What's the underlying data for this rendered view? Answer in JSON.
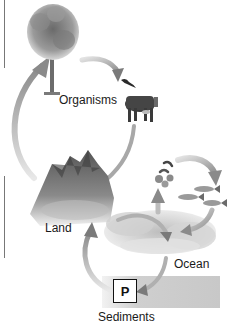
{
  "diagram": {
    "nodes": [
      {
        "id": "organisms",
        "label": "Organisms"
      },
      {
        "id": "land",
        "label": "Land"
      },
      {
        "id": "ocean",
        "label": "Ocean"
      },
      {
        "id": "sediments",
        "label": "Sediments"
      }
    ],
    "sediment_box_label": "P",
    "icons": [
      "tree-icon",
      "cow-icon",
      "bird-icon",
      "mountain-icon",
      "fish-icon",
      "phosphate-particles-icon",
      "ocean-wave-icon"
    ],
    "colors": {
      "arrow": "#9a9a9a",
      "arrow_head": "#808080",
      "text": "#1a1a1a",
      "sediment": "#cfcfcf"
    }
  }
}
